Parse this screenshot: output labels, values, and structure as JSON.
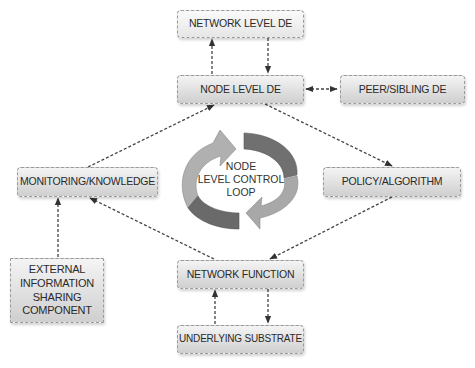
{
  "diagram": {
    "nodes": {
      "network_level_de": {
        "label": "NETWORK LEVEL DE"
      },
      "node_level_de": {
        "label": "NODE LEVEL DE"
      },
      "peer_sibling_de": {
        "label": "PEER/SIBLING DE"
      },
      "monitoring_knowledge": {
        "label": "MONITORING/KNOWLEDGE"
      },
      "policy_algorithm": {
        "label": "POLICY/ALGORITHM"
      },
      "external_info": {
        "label": "EXTERNAL INFORMATION SHARING COMPONENT"
      },
      "network_function": {
        "label": "NETWORK FUNCTION"
      },
      "underlying_substrate": {
        "label": "UNDERLYING SUBSTRATE"
      }
    },
    "loop": {
      "label_line1": "NODE",
      "label_line2": "LEVEL CONTROL",
      "label_line3": "LOOP",
      "arrow_light_color": "#a8a8a8",
      "arrow_dark_color": "#6e6e6e"
    },
    "edges": [
      {
        "from": "node_level_de",
        "to": "network_level_de",
        "style": "dashed"
      },
      {
        "from": "network_level_de",
        "to": "node_level_de",
        "style": "dashed"
      },
      {
        "from": "node_level_de",
        "to": "peer_sibling_de",
        "style": "dashed",
        "bidirectional": true
      },
      {
        "from": "node_level_de",
        "to": "policy_algorithm",
        "style": "dashed"
      },
      {
        "from": "monitoring_knowledge",
        "to": "node_level_de",
        "style": "dashed"
      },
      {
        "from": "policy_algorithm",
        "to": "network_function",
        "style": "dashed"
      },
      {
        "from": "network_function",
        "to": "monitoring_knowledge",
        "style": "dashed"
      },
      {
        "from": "external_info",
        "to": "monitoring_knowledge",
        "style": "dashed"
      },
      {
        "from": "network_function",
        "to": "underlying_substrate",
        "style": "dashed"
      },
      {
        "from": "underlying_substrate",
        "to": "network_function",
        "style": "dashed"
      }
    ]
  }
}
